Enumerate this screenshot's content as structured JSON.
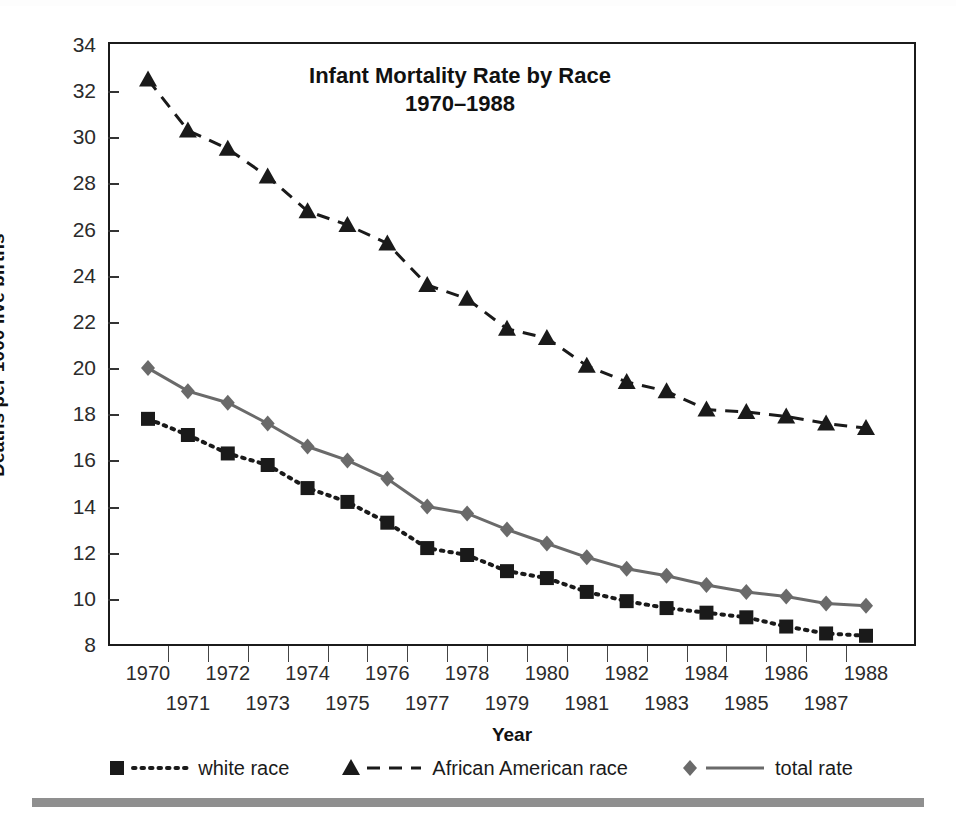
{
  "chart_data": {
    "type": "line",
    "title_line1": "Infant Mortality Rate by Race",
    "title_line2": "1970–1988",
    "xlabel": "Year",
    "ylabel": "Deaths per 1000 live births",
    "grid": false,
    "legend_position": "bottom",
    "xlim": [
      1970,
      1988
    ],
    "ylim": [
      8,
      34
    ],
    "ytick_labels": [
      "34",
      "32",
      "30",
      "28",
      "26",
      "24",
      "22",
      "20",
      "18",
      "16",
      "14",
      "12",
      "10",
      "8"
    ],
    "yticks": [
      34,
      32,
      30,
      28,
      26,
      24,
      22,
      20,
      18,
      16,
      14,
      12,
      10,
      8
    ],
    "categories": [
      1970,
      1971,
      1972,
      1973,
      1974,
      1975,
      1976,
      1977,
      1978,
      1979,
      1980,
      1981,
      1982,
      1983,
      1984,
      1985,
      1986,
      1987,
      1988
    ],
    "xtick_labels": [
      "1970",
      "1971",
      "1972",
      "1973",
      "1974",
      "1975",
      "1976",
      "1977",
      "1978",
      "1979",
      "1980",
      "1981",
      "1982",
      "1983",
      "1984",
      "1985",
      "1986",
      "1987",
      "1988"
    ],
    "series": [
      {
        "name": "white race",
        "marker": "square",
        "line_style": "dotted",
        "color": "#1a1a1a",
        "values": [
          17.8,
          17.1,
          16.3,
          15.8,
          14.8,
          14.2,
          13.3,
          12.2,
          11.9,
          11.2,
          10.9,
          10.3,
          9.9,
          9.6,
          9.4,
          9.2,
          8.8,
          8.5,
          8.4
        ]
      },
      {
        "name": "African American race",
        "marker": "triangle",
        "line_style": "dashed",
        "color": "#1a1a1a",
        "values": [
          32.5,
          30.3,
          29.5,
          28.3,
          26.8,
          26.2,
          25.4,
          23.6,
          23.0,
          21.7,
          21.3,
          20.1,
          19.4,
          19.0,
          18.2,
          18.1,
          17.9,
          17.6,
          17.4
        ]
      },
      {
        "name": "total rate",
        "marker": "diamond",
        "line_style": "solid",
        "color": "#6a6a6a",
        "values": [
          20.0,
          19.0,
          18.5,
          17.6,
          16.6,
          16.0,
          15.2,
          14.0,
          13.7,
          13.0,
          12.4,
          11.8,
          11.3,
          11.0,
          10.6,
          10.3,
          10.1,
          9.8,
          9.7
        ]
      }
    ]
  },
  "legend": {
    "items": [
      {
        "label": "white race",
        "marker": "square",
        "line_style": "dotted",
        "color": "#1a1a1a"
      },
      {
        "label": "African American race",
        "marker": "triangle",
        "line_style": "dashed",
        "color": "#1a1a1a"
      },
      {
        "label": "total rate",
        "marker": "diamond",
        "line_style": "solid",
        "color": "#6a6a6a"
      }
    ]
  }
}
